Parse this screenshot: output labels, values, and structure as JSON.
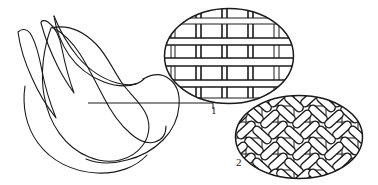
{
  "figure": {
    "background_color": "#ffffff",
    "ink_color": "#1a1a1a",
    "width": 378,
    "height": 185
  },
  "subject": {
    "name": "tulip-bud-outline",
    "description": "Hand-drawn closed tulip bud with two outer petal leaves, rendered as open line art"
  },
  "leader": {
    "name": "callout-leader-line",
    "from_x": 88,
    "from_y": 103,
    "to_x": 213,
    "to_y": 103
  },
  "callouts": [
    {
      "id": "1",
      "label": "1",
      "name": "detail-plain-weave",
      "pattern_type": "plain-weave-grid",
      "label_x": 214,
      "label_y": 110,
      "center_x": 229,
      "center_y": 56,
      "rx": 65,
      "ry": 48
    },
    {
      "id": "2",
      "label": "2",
      "name": "detail-twill-weave",
      "pattern_type": "twill-basket-weave",
      "label_x": 240,
      "label_y": 163,
      "center_x": 299,
      "center_y": 137,
      "rx": 64,
      "ry": 42
    }
  ]
}
